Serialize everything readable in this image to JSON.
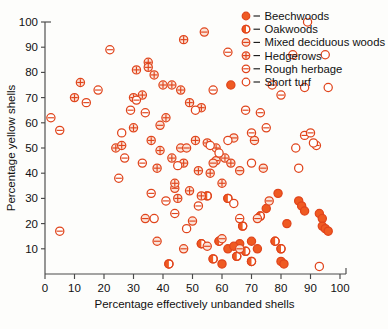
{
  "chart_data": {
    "type": "scatter",
    "title": "",
    "xlabel": "Percentage effectively unbanded shells",
    "ylabel": "Percentage yellow shells",
    "xlim": [
      0,
      100
    ],
    "ylim": [
      0,
      100
    ],
    "xticks": [
      0,
      10,
      20,
      30,
      40,
      50,
      60,
      70,
      80,
      90,
      100
    ],
    "yticks": [
      10,
      20,
      30,
      40,
      50,
      60,
      70,
      80,
      90,
      100
    ],
    "grid": false,
    "legend_position": "top-right",
    "marker_color": "#e8491e",
    "series": [
      {
        "name": "Beechwoods",
        "marker": "filled-circle",
        "points": [
          [
            63,
            75
          ],
          [
            79,
            32
          ],
          [
            86,
            29
          ],
          [
            87,
            27
          ],
          [
            88,
            25
          ],
          [
            93,
            24
          ],
          [
            94,
            22
          ],
          [
            94,
            19
          ],
          [
            95,
            18
          ],
          [
            96,
            17
          ],
          [
            75,
            26
          ],
          [
            82,
            20
          ],
          [
            80,
            5
          ],
          [
            81,
            4
          ],
          [
            70,
            13
          ],
          [
            66,
            12
          ],
          [
            72,
            10
          ],
          [
            62,
            10
          ],
          [
            64,
            11
          ],
          [
            60,
            4
          ]
        ]
      },
      {
        "name": "Oakwoods",
        "marker": "half-filled-circle",
        "points": [
          [
            42,
            4
          ],
          [
            57,
            6
          ],
          [
            65,
            7
          ],
          [
            67,
            19
          ],
          [
            70,
            5
          ],
          [
            78,
            13
          ],
          [
            62,
            30
          ],
          [
            55,
            31
          ],
          [
            73,
            23
          ],
          [
            80,
            10
          ],
          [
            59,
            13
          ],
          [
            53,
            12
          ],
          [
            68,
            9
          ]
        ]
      },
      {
        "name": "Mixed deciduous woods",
        "marker": "horizontal-bar-circle",
        "points": [
          [
            54,
            96
          ],
          [
            64,
            54
          ],
          [
            71,
            53
          ],
          [
            46,
            50
          ],
          [
            48,
            50
          ],
          [
            58,
            45
          ],
          [
            66,
            41
          ],
          [
            74,
            42
          ],
          [
            76,
            29
          ],
          [
            55,
            11
          ],
          [
            66,
            10
          ],
          [
            50,
            21
          ],
          [
            44,
            34
          ],
          [
            72,
            22
          ],
          [
            39,
            59
          ],
          [
            34,
            22
          ],
          [
            38,
            13
          ],
          [
            47,
            10
          ],
          [
            57,
            44
          ],
          [
            60,
            14
          ]
        ]
      },
      {
        "name": "Hedgerows",
        "marker": "crossed-circle",
        "points": [
          [
            47,
            93
          ],
          [
            35,
            84
          ],
          [
            35,
            82
          ],
          [
            31,
            81
          ],
          [
            37,
            79
          ],
          [
            40,
            75
          ],
          [
            43,
            75
          ],
          [
            46,
            73
          ],
          [
            33,
            71
          ],
          [
            30,
            70
          ],
          [
            10,
            70
          ],
          [
            12,
            76
          ],
          [
            49,
            68
          ],
          [
            53,
            66
          ],
          [
            41,
            62
          ],
          [
            30,
            58
          ],
          [
            36,
            53
          ],
          [
            51,
            53
          ],
          [
            55,
            52
          ],
          [
            58,
            50
          ],
          [
            43,
            46
          ],
          [
            47,
            44
          ],
          [
            52,
            41
          ],
          [
            56,
            40
          ],
          [
            38,
            42
          ],
          [
            44,
            36
          ],
          [
            49,
            33
          ],
          [
            53,
            31
          ],
          [
            45,
            30
          ],
          [
            39,
            49
          ],
          [
            24,
            50
          ],
          [
            26,
            51
          ],
          [
            61,
            46
          ],
          [
            63,
            44
          ],
          [
            60,
            36
          ]
        ]
      },
      {
        "name": "Rough herbage",
        "marker": "line-circle",
        "points": [
          [
            2,
            62
          ],
          [
            5,
            57
          ],
          [
            5,
            17
          ],
          [
            14,
            68
          ],
          [
            29,
            65
          ],
          [
            22,
            89
          ],
          [
            62,
            88
          ],
          [
            57,
            73
          ],
          [
            68,
            65
          ],
          [
            73,
            64
          ],
          [
            77,
            75
          ],
          [
            84,
            87
          ],
          [
            80,
            71
          ],
          [
            88,
            55
          ],
          [
            90,
            56
          ],
          [
            92,
            51
          ],
          [
            34,
            64
          ],
          [
            27,
            46
          ],
          [
            33,
            44
          ],
          [
            41,
            29
          ],
          [
            36,
            32
          ],
          [
            25,
            38
          ],
          [
            70,
            56
          ],
          [
            75,
            58
          ],
          [
            66,
            22
          ],
          [
            31,
            69
          ],
          [
            44,
            24
          ],
          [
            18,
            73
          ],
          [
            52,
            27
          ]
        ]
      },
      {
        "name": "Short turf",
        "marker": "open-circle",
        "points": [
          [
            89,
            100
          ],
          [
            96,
            74
          ],
          [
            88,
            74
          ],
          [
            95,
            87
          ],
          [
            51,
            65
          ],
          [
            56,
            51
          ],
          [
            59,
            48
          ],
          [
            45,
            43
          ],
          [
            37,
            22
          ],
          [
            93,
            3
          ],
          [
            86,
            42
          ],
          [
            91,
            52
          ],
          [
            85,
            50
          ],
          [
            64,
            28
          ],
          [
            70,
            44
          ],
          [
            26,
            56
          ],
          [
            48,
            18
          ],
          [
            62,
            53
          ]
        ]
      }
    ]
  },
  "legend": {
    "entries": [
      {
        "label": "Beechwoods",
        "marker": "filled-circle"
      },
      {
        "label": "Oakwoods",
        "marker": "half-filled-circle"
      },
      {
        "label": "Mixed deciduous woods",
        "marker": "horizontal-bar-circle"
      },
      {
        "label": "Hedgerows",
        "marker": "crossed-circle"
      },
      {
        "label": "Rough herbage",
        "marker": "line-circle"
      },
      {
        "label": "Short turf",
        "marker": "open-circle"
      }
    ]
  }
}
